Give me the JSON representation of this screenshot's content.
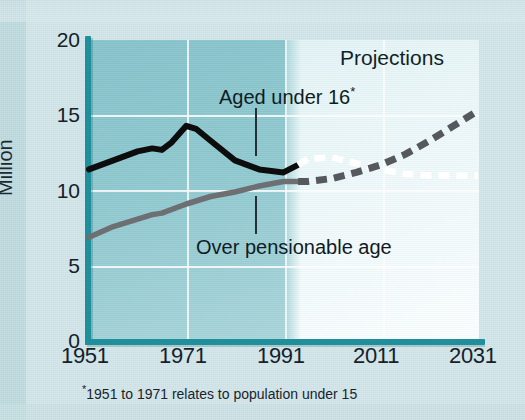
{
  "chart_data": {
    "type": "line",
    "title": "",
    "xlabel": "",
    "ylabel": "Million",
    "xlim": [
      1951,
      2031
    ],
    "ylim": [
      0,
      20
    ],
    "yticks": [
      0,
      5,
      10,
      15,
      20
    ],
    "xticks": [
      1951,
      1971,
      1991,
      2011,
      2031
    ],
    "grid": true,
    "legend": "inline annotations",
    "annotations": [
      "Aged under 16*",
      "Over pensionable age",
      "Projections"
    ],
    "footnote": "*1951 to 1971 relates to population under 15",
    "projection_start_year": 1994,
    "series": [
      {
        "name": "Aged under 16*",
        "style": "solid-black-then-white-dashed",
        "color_actual": "#0d0d0d",
        "color_projection": "#ffffff",
        "x": [
          1951,
          1956,
          1961,
          1964,
          1966,
          1968,
          1971,
          1973,
          1976,
          1981,
          1986,
          1991,
          1994,
          1996,
          2001,
          2006,
          2011,
          2016,
          2021,
          2026,
          2031
        ],
        "values": [
          11.4,
          12.0,
          12.6,
          12.8,
          12.7,
          13.2,
          14.3,
          14.1,
          13.3,
          12.0,
          11.4,
          11.2,
          11.7,
          12.1,
          12.2,
          11.8,
          11.4,
          11.1,
          11.0,
          11.0,
          11.0
        ]
      },
      {
        "name": "Over pensionable age",
        "style": "solid-grey-then-grey-dashed",
        "color_actual": "#6d6f72",
        "color_projection": "#55585c",
        "x": [
          1951,
          1956,
          1961,
          1964,
          1966,
          1971,
          1976,
          1981,
          1986,
          1991,
          1994,
          1996,
          2001,
          2006,
          2011,
          2016,
          2021,
          2026,
          2031
        ],
        "values": [
          6.9,
          7.6,
          8.1,
          8.4,
          8.5,
          9.1,
          9.6,
          9.9,
          10.3,
          10.6,
          10.6,
          10.6,
          10.8,
          11.2,
          11.7,
          12.4,
          13.3,
          14.3,
          15.3
        ]
      }
    ]
  },
  "axis": {
    "y_label": "Million",
    "y_ticks": [
      "0",
      "5",
      "10",
      "15",
      "20"
    ],
    "x_ticks": [
      "1951",
      "1971",
      "1991",
      "2011",
      "2031"
    ]
  },
  "labels": {
    "projections": "Projections",
    "under16": "Aged under 16",
    "under16_star": "*",
    "pensionable": "Over pensionable age",
    "footnote_star": "*",
    "footnote_text": "1951 to 1971 relates to population under 15"
  },
  "colors": {
    "background": "#cfe4e8",
    "panel_dark": "#8ec8cf",
    "panel_light": "#f2fafb",
    "axis": "#1f8f9c",
    "series_under16": "#0d0d0d",
    "series_pensionable": "#6d6f72",
    "projection_white": "#ffffff",
    "projection_grey": "#55585c"
  }
}
